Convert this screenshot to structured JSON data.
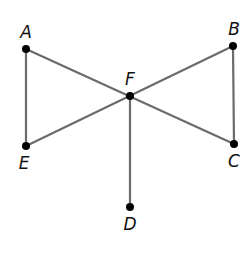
{
  "diagram": {
    "type": "geometry-figure",
    "colors": {
      "line": "#6b6b6b",
      "point": "#000000",
      "label": "#111111",
      "background": "#ffffff"
    },
    "points": [
      {
        "name": "A",
        "label": "A",
        "x": 26,
        "y": 49,
        "lx": 26,
        "ly": 38
      },
      {
        "name": "B",
        "label": "B",
        "x": 233,
        "y": 46,
        "lx": 234,
        "ly": 35
      },
      {
        "name": "F",
        "label": "F",
        "x": 130,
        "y": 96,
        "lx": 130,
        "ly": 85
      },
      {
        "name": "E",
        "label": "E",
        "x": 26,
        "y": 146,
        "lx": 24,
        "ly": 169
      },
      {
        "name": "C",
        "label": "C",
        "x": 234,
        "y": 144,
        "lx": 234,
        "ly": 167
      },
      {
        "name": "D",
        "label": "D",
        "x": 130,
        "y": 207,
        "lx": 130,
        "ly": 230
      }
    ],
    "segments": [
      {
        "from": "A",
        "to": "E"
      },
      {
        "from": "A",
        "to": "C"
      },
      {
        "from": "E",
        "to": "B"
      },
      {
        "from": "B",
        "to": "C"
      },
      {
        "from": "F",
        "to": "D"
      }
    ]
  }
}
